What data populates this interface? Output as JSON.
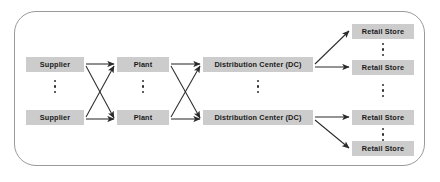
{
  "diagram": {
    "frame": {
      "name": "supply-chain-boundary",
      "border_color": "#9a9a9a",
      "corner_radius": 22
    },
    "style": {
      "node_fill": "#cccccc",
      "node_text_color": "#1a1a1a",
      "arrow_color": "#2b2b2b"
    },
    "stages": [
      {
        "id": "supplier",
        "label": "Supplier",
        "nodes": [
          {
            "label": "Supplier",
            "x": 26,
            "y": 60,
            "w": 58
          },
          {
            "label": "Supplier",
            "x": 26,
            "y": 112,
            "w": 58
          }
        ],
        "ellipsis": {
          "x": 50,
          "y": 80,
          "visible": true
        }
      },
      {
        "id": "plant",
        "label": "Plant",
        "nodes": [
          {
            "label": "Plant",
            "x": 117,
            "y": 60,
            "w": 52
          },
          {
            "label": "Plant",
            "x": 117,
            "y": 112,
            "w": 52
          }
        ],
        "ellipsis": {
          "x": 138,
          "y": 80,
          "visible": true
        }
      },
      {
        "id": "distribution-center",
        "label": "Distribution Center (DC)",
        "nodes": [
          {
            "label": "Distribution Center (DC)",
            "x": 203,
            "y": 60,
            "w": 110
          },
          {
            "label": "Distribution Center (DC)",
            "x": 203,
            "y": 112,
            "w": 110
          }
        ],
        "ellipsis": {
          "x": 253,
          "y": 80,
          "visible": true
        }
      },
      {
        "id": "retail-store",
        "label": "Retail Store",
        "nodes": [
          {
            "label": "Retail Store",
            "x": 352,
            "y": 25,
            "w": 62
          },
          {
            "label": "Retail Store",
            "x": 352,
            "y": 60,
            "w": 62
          },
          {
            "label": "Retail Store",
            "x": 352,
            "y": 112,
            "w": 62
          },
          {
            "label": "Retail Store",
            "x": 352,
            "y": 142,
            "w": 62
          }
        ],
        "ellipsis_top": {
          "x": 378,
          "y": 44,
          "visible": true
        },
        "ellipsis_mid": {
          "x": 378,
          "y": 82,
          "visible": true
        },
        "ellipsis_bottom": {
          "x": 378,
          "y": 129,
          "visible": true
        }
      }
    ],
    "edges": [
      {
        "from": "supplier-1",
        "to": "plant-1",
        "type": "straight"
      },
      {
        "from": "supplier-1",
        "to": "plant-2",
        "type": "cross"
      },
      {
        "from": "supplier-2",
        "to": "plant-1",
        "type": "cross"
      },
      {
        "from": "supplier-2",
        "to": "plant-2",
        "type": "straight"
      },
      {
        "from": "plant-1",
        "to": "dc-1",
        "type": "straight"
      },
      {
        "from": "plant-1",
        "to": "dc-2",
        "type": "cross"
      },
      {
        "from": "plant-2",
        "to": "dc-1",
        "type": "cross"
      },
      {
        "from": "plant-2",
        "to": "dc-2",
        "type": "straight"
      },
      {
        "from": "dc-1",
        "to": "retail-1",
        "type": "diagonal-up"
      },
      {
        "from": "dc-1",
        "to": "retail-2",
        "type": "straight"
      },
      {
        "from": "dc-2",
        "to": "retail-3",
        "type": "straight"
      },
      {
        "from": "dc-2",
        "to": "retail-4",
        "type": "diagonal-down"
      }
    ]
  }
}
